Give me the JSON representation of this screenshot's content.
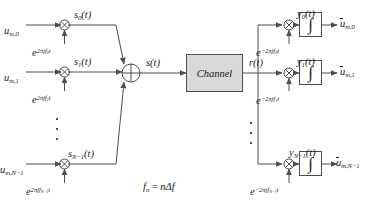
{
  "diagram": {
    "caption": "f_n = nΔf",
    "colors": {
      "line": "#4d4d4d",
      "text": "#1a1a1a",
      "channel_fill": "#d9d9d9",
      "integrator_fill": "#ffffff",
      "background": "#ffffff"
    }
  },
  "transmitter": {
    "branches": [
      {
        "input_label": "u",
        "input_sub": "m,0",
        "carrier_label": "e",
        "carrier_exp": "2πjf",
        "carrier_exp_sub": "0",
        "carrier_exp_tail": "t",
        "output_label": "s",
        "output_sub": "0",
        "output_tail": "(t)",
        "mixer_icon": "multiply-icon"
      },
      {
        "input_label": "u",
        "input_sub": "m,1",
        "carrier_label": "e",
        "carrier_exp": "2πjf",
        "carrier_exp_sub": "1",
        "carrier_exp_tail": "t",
        "output_label": "s",
        "output_sub": "1",
        "output_tail": "(t)",
        "mixer_icon": "multiply-icon"
      },
      {
        "input_label": "u",
        "input_sub": "m,N−1",
        "carrier_label": "e",
        "carrier_exp": "2πjf",
        "carrier_exp_sub": "N−1",
        "carrier_exp_tail": "t",
        "output_label": "s",
        "output_sub": "N−1",
        "output_tail": "(t)",
        "mixer_icon": "multiply-icon"
      }
    ],
    "summer_icon": "sum-junction-icon",
    "sum_output": "s(t)",
    "ellipsis_icon": "vertical-ellipsis-icon"
  },
  "channel": {
    "label": "Channel",
    "input_signal": "s(t)",
    "output_signal": "r(t)"
  },
  "receiver": {
    "branches": [
      {
        "carrier_label": "e",
        "carrier_exp": "−2πjf",
        "carrier_exp_sub": "0",
        "carrier_exp_tail": "t",
        "mix_out_label": "y",
        "mix_out_sub": "0",
        "mix_out_tail": "(t)",
        "integrator_glyph": "∫",
        "integrator_icon": "integrator-icon",
        "output_label": "û",
        "output_base": "u",
        "output_sub": "m,0",
        "mixer_icon": "multiply-icon"
      },
      {
        "carrier_label": "e",
        "carrier_exp": "−2πjf",
        "carrier_exp_sub": "1",
        "carrier_exp_tail": "t",
        "mix_out_label": "y",
        "mix_out_sub": "1",
        "mix_out_tail": "(t)",
        "integrator_glyph": "∫",
        "integrator_icon": "integrator-icon",
        "output_label": "û",
        "output_base": "u",
        "output_sub": "m,1",
        "mixer_icon": "multiply-icon"
      },
      {
        "carrier_label": "e",
        "carrier_exp": "−2πjf",
        "carrier_exp_sub": "N−1",
        "carrier_exp_tail": "t",
        "mix_out_label": "y",
        "mix_out_sub": "N−1",
        "mix_out_tail": "(t)",
        "integrator_glyph": "∫",
        "integrator_icon": "integrator-icon",
        "output_label": "û",
        "output_base": "u",
        "output_sub": "m,N−1",
        "mixer_icon": "multiply-icon"
      }
    ],
    "ellipsis_icon": "vertical-ellipsis-icon"
  },
  "caption": {
    "f": "f",
    "f_sub": "n",
    "equals": " = ",
    "rhs": "nΔf"
  }
}
